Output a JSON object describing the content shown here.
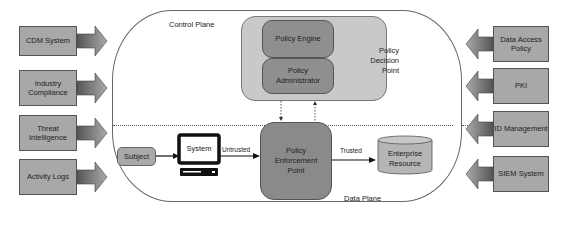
{
  "left_sources": [
    {
      "label": "CDM System"
    },
    {
      "label": "Industry Compliance"
    },
    {
      "label": "Threat Intelligence"
    },
    {
      "label": "Activity Logs"
    }
  ],
  "right_sources": [
    {
      "label": "Data Access Policy"
    },
    {
      "label": "PKI"
    },
    {
      "label": "ID Management"
    },
    {
      "label": "SIEM System"
    }
  ],
  "control_plane": {
    "label": "Control Plane"
  },
  "data_plane": {
    "label": "Data Plane"
  },
  "pdp": {
    "label": "Policy Decision Point",
    "engine": "Policy Engine",
    "administrator": "Policy Administrator"
  },
  "pep": {
    "label": "Policy Enforcement Point"
  },
  "subject": {
    "label": "Subject"
  },
  "system": {
    "label": "System"
  },
  "resource": {
    "label": "Enterprise Resource"
  },
  "edges": {
    "untrusted": "Untrusted",
    "trusted": "Trusted"
  },
  "colors": {
    "box_gray": "#a8a8a8",
    "dark_gray": "#8a8a8a",
    "pdp_bg": "#c9c9c9"
  }
}
